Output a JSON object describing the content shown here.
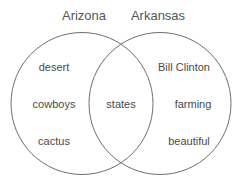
{
  "diagram": {
    "type": "venn",
    "sets": [
      {
        "name": "Arizona",
        "items": [
          "desert",
          "cowboys",
          "cactus"
        ]
      },
      {
        "name": "Arkansas",
        "items": [
          "Bill Clinton",
          "farming",
          "beautiful"
        ]
      }
    ],
    "intersection": [
      "states"
    ],
    "colors": {
      "stroke": "#6e6e6e",
      "text": "#4a4a4a",
      "background": "#ffffff"
    }
  }
}
